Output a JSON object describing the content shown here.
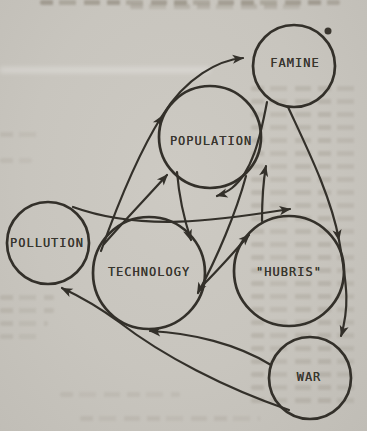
{
  "page": {
    "kind": "scanned book page with causal-loop diagram"
  },
  "diagram": {
    "ink_color": "#33302a",
    "paper_color": "#c8c5be",
    "nodes": [
      {
        "id": "famine",
        "label": "FAMINE",
        "cx": 294,
        "cy": 66,
        "r": 41,
        "lx": 295,
        "ly": 63
      },
      {
        "id": "population",
        "label": "POPULATION",
        "cx": 210,
        "cy": 137,
        "r": 51,
        "lx": 211,
        "ly": 141
      },
      {
        "id": "pollution",
        "label": "POLLUTION",
        "cx": 48,
        "cy": 243,
        "r": 41,
        "lx": 47,
        "ly": 243
      },
      {
        "id": "technology",
        "label": "TECHNOLOGY",
        "cx": 149,
        "cy": 273,
        "r": 56,
        "lx": 149,
        "ly": 272
      },
      {
        "id": "hubris",
        "label": "\"HUBRIS\"",
        "cx": 289,
        "cy": 271,
        "r": 55,
        "lx": 289,
        "ly": 272
      },
      {
        "id": "war",
        "label": "WAR",
        "cx": 310,
        "cy": 378,
        "r": 41,
        "lx": 309,
        "ly": 377
      }
    ],
    "edges": [
      {
        "name": "technology-to-famine",
        "path": "M 101 251 C 122 192 141 149 162 116 C 186 77 219 60 243 58",
        "arrows": [
          {
            "x": 163,
            "y": 115,
            "a": -57
          },
          {
            "x": 244,
            "y": 58,
            "a": -6
          }
        ]
      },
      {
        "name": "famine-to-war",
        "path": "M 288 107 C 307 148 331 196 339 240 C 348 290 349 308 341 336",
        "arrows": [
          {
            "x": 339,
            "y": 241,
            "a": 80
          },
          {
            "x": 341,
            "y": 337,
            "a": 106
          }
        ]
      },
      {
        "name": "war-to-pollution",
        "path": "M 289 410 C 225 388 163 356 119 322 C 96 305 79 296 62 288",
        "arrows": [
          {
            "x": 61,
            "y": 288,
            "a": 205
          }
        ]
      },
      {
        "name": "war-to-technology",
        "path": "M 271 365 C 237 344 192 333 150 331",
        "arrows": [
          {
            "x": 149,
            "y": 331,
            "a": 184
          }
        ]
      },
      {
        "name": "famine-to-population",
        "path": "M 267 102 C 260 139 252 172 232 188 C 227 192 222 194 217 196",
        "arrows": [
          {
            "x": 216,
            "y": 196,
            "a": 165
          }
        ]
      },
      {
        "name": "pollution-to-hubris",
        "path": "M 73 207 C 145 233 225 219 290 209",
        "arrows": [
          {
            "x": 291,
            "y": 209,
            "a": -8
          }
        ]
      },
      {
        "name": "junction-to-population",
        "path": "M 104 244 C 126 219 148 196 167 175",
        "arrows": [
          {
            "x": 168,
            "y": 174,
            "a": -48
          }
        ]
      },
      {
        "name": "population-to-technology",
        "path": "M 177 172 C 179 196 184 219 191 240",
        "arrows": [
          {
            "x": 191,
            "y": 241,
            "a": 72
          }
        ]
      },
      {
        "name": "population-to-technology-right",
        "path": "M 246 176 C 236 213 217 258 198 293",
        "arrows": [
          {
            "x": 197,
            "y": 294,
            "a": 118
          }
        ]
      },
      {
        "name": "technology-to-hubris",
        "path": "M 203 285 C 221 267 235 251 249 235",
        "arrows": [
          {
            "x": 250,
            "y": 234,
            "a": -45
          }
        ]
      },
      {
        "name": "hubris-to-population",
        "path": "M 262 221 C 262 201 263 183 266 166",
        "arrows": [
          {
            "x": 266,
            "y": 165,
            "a": -78
          }
        ]
      }
    ],
    "dot": {
      "x": 328,
      "y": 31,
      "r": 3.5
    }
  }
}
